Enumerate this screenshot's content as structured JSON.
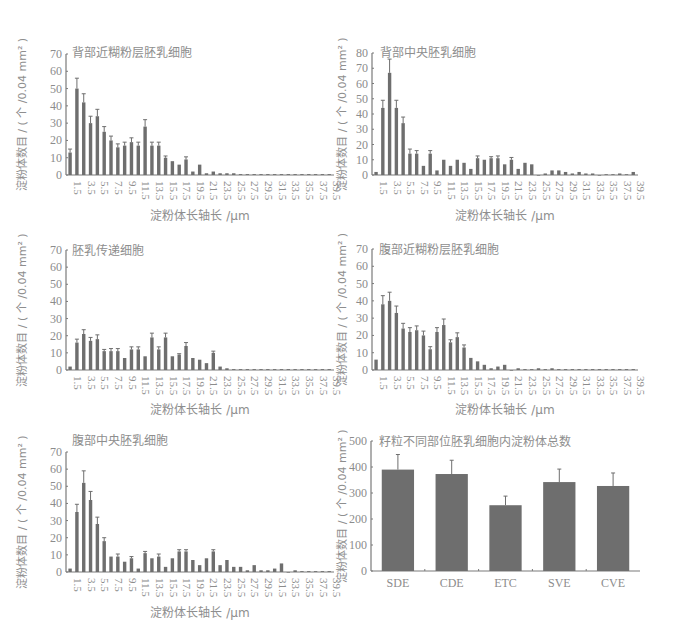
{
  "chart_data": [
    {
      "id": "sde",
      "type": "bar",
      "title": "背部近糊粉层胚乳细胞",
      "xlabel": "淀粉体长轴长 /μm",
      "ylabel": "淀粉体数目 / ( 个 /0.04 mm² )",
      "ylim": [
        0,
        70
      ],
      "yticks": [
        0,
        10,
        20,
        30,
        40,
        50,
        60,
        70
      ],
      "categories": [
        1.5,
        2.5,
        3.5,
        4.5,
        5.5,
        6.5,
        7.5,
        8.5,
        9.5,
        10.5,
        11.5,
        12.5,
        13.5,
        14.5,
        15.5,
        16.5,
        17.5,
        18.5,
        19.5,
        20.5,
        21.5,
        22.5,
        23.5,
        24.5,
        25.5,
        26.5,
        27.5,
        28.5,
        29.5,
        30.5,
        31.5,
        32.5,
        33.5,
        34.5,
        35.5,
        36.5,
        37.5,
        38.5,
        39.5
      ],
      "xtick_labels": [
        "1.5",
        "3.5",
        "5.5",
        "7.5",
        "9.5",
        "11.5",
        "13.5",
        "15.5",
        "17.5",
        "19.5",
        "21.5",
        "23.5",
        "25.5",
        "27.5",
        "29.5",
        "31.5",
        "33.5",
        "35.5",
        "37.5",
        "39.5"
      ],
      "values": [
        13,
        50,
        42,
        30,
        34,
        25,
        20,
        16,
        17,
        19,
        17,
        28,
        17,
        17,
        10,
        8,
        6,
        9,
        2,
        6,
        1,
        2,
        1,
        1,
        1,
        0.5,
        0.5,
        0.5,
        0.5,
        0.5,
        0.5,
        0.5,
        0.5,
        0.5,
        0.5,
        0.5,
        0.5,
        0.5,
        0.5
      ],
      "errors": [
        2,
        6,
        5,
        4,
        4,
        3,
        2.5,
        2,
        2,
        2.5,
        2,
        4,
        2,
        2,
        1,
        0,
        0,
        1.5,
        0,
        0,
        0,
        0,
        0,
        0,
        0,
        0,
        0,
        0,
        0,
        0,
        0,
        0,
        0,
        0,
        0,
        0,
        0,
        0,
        0
      ]
    },
    {
      "id": "cde",
      "type": "bar",
      "title": "背部中央胚乳细胞",
      "xlabel": "淀粉体长轴长 /μm",
      "ylabel": "淀粉体数目 / ( 个 /0.04 mm² )",
      "ylim": [
        0,
        80
      ],
      "yticks": [
        0,
        10,
        20,
        30,
        40,
        50,
        60,
        70,
        80
      ],
      "categories": [
        1.5,
        2.5,
        3.5,
        4.5,
        5.5,
        6.5,
        7.5,
        8.5,
        9.5,
        10.5,
        11.5,
        12.5,
        13.5,
        14.5,
        15.5,
        16.5,
        17.5,
        18.5,
        19.5,
        20.5,
        21.5,
        22.5,
        23.5,
        24.5,
        25.5,
        26.5,
        27.5,
        28.5,
        29.5,
        30.5,
        31.5,
        32.5,
        33.5,
        34.5,
        35.5,
        36.5,
        37.5,
        38.5,
        39.5
      ],
      "xtick_labels": [
        "1.5",
        "3.5",
        "5.5",
        "7.5",
        "9.5",
        "11.5",
        "13.5",
        "15.5",
        "17.5",
        "19.5",
        "21.5",
        "23.5",
        "25.5",
        "27.5",
        "29.5",
        "31.5",
        "33.5",
        "35.5",
        "37.5",
        "39.5"
      ],
      "values": [
        2,
        44,
        67,
        44,
        34,
        14,
        14,
        6,
        14,
        3,
        10,
        6,
        10,
        8,
        4,
        11,
        10,
        11,
        11,
        7,
        10,
        4,
        8,
        7,
        0,
        1,
        3,
        3,
        2,
        1,
        2,
        1,
        1,
        0,
        0.5,
        0.5,
        1,
        0.5,
        2
      ],
      "errors": [
        0,
        5,
        9,
        5,
        4,
        3,
        2,
        0,
        2,
        0,
        0,
        0,
        0,
        0,
        0,
        1.5,
        0,
        1,
        1.5,
        0,
        1.5,
        0,
        0,
        0,
        0,
        0,
        0,
        0,
        0,
        0,
        0,
        0,
        0,
        0,
        0,
        0,
        0,
        0,
        0
      ]
    },
    {
      "id": "etc",
      "type": "bar",
      "title": "胚乳传递细胞",
      "xlabel": "淀粉体长轴长 /μm",
      "ylabel": "淀粉体数目 / ( 个 /0.04 mm² )",
      "ylim": [
        0,
        70
      ],
      "yticks": [
        0,
        10,
        20,
        30,
        40,
        50,
        60,
        70
      ],
      "categories": [
        1.5,
        2.5,
        3.5,
        4.5,
        5.5,
        6.5,
        7.5,
        8.5,
        9.5,
        10.5,
        11.5,
        12.5,
        13.5,
        14.5,
        15.5,
        16.5,
        17.5,
        18.5,
        19.5,
        20.5,
        21.5,
        22.5,
        23.5,
        24.5,
        25.5,
        26.5,
        27.5,
        28.5,
        29.5,
        30.5,
        31.5,
        32.5,
        33.5,
        34.5,
        35.5,
        36.5,
        37.5,
        38.5,
        39.5
      ],
      "xtick_labels": [
        "1.5",
        "3.5",
        "5.5",
        "7.5",
        "9.5",
        "11.5",
        "13.5",
        "15.5",
        "17.5",
        "19.5",
        "21.5",
        "23.5",
        "25.5",
        "27.5",
        "29.5",
        "31.5",
        "33.5",
        "35.5",
        "37.5",
        "39.5"
      ],
      "values": [
        2,
        16,
        21,
        17,
        18,
        11,
        11,
        11,
        7,
        12,
        12,
        8,
        19,
        12,
        19,
        8,
        9,
        14,
        7,
        6,
        4,
        10,
        2,
        1,
        0.5,
        0.5,
        0.5,
        0.5,
        0.5,
        0.5,
        0.5,
        0.5,
        0.5,
        0.5,
        0.5,
        0.5,
        0.5,
        0.5,
        0.5
      ],
      "errors": [
        0,
        2,
        2.5,
        2,
        2.5,
        1,
        1.5,
        1.5,
        0,
        1.5,
        1.5,
        0,
        2.5,
        1.5,
        2.5,
        0,
        0.5,
        2,
        0,
        0,
        0,
        1,
        0,
        0,
        0,
        0,
        0,
        0,
        0,
        0,
        0,
        0,
        0,
        0,
        0,
        0,
        0,
        0,
        0
      ]
    },
    {
      "id": "sve",
      "type": "bar",
      "title": "腹部近糊粉层胚乳细胞",
      "xlabel": "淀粉体长轴长 /μm",
      "ylabel": "淀粉体数目 / ( 个 /0.04 mm² )",
      "ylim": [
        0,
        70
      ],
      "yticks": [
        0,
        10,
        20,
        30,
        40,
        50,
        60,
        70
      ],
      "categories": [
        1.5,
        2.5,
        3.5,
        4.5,
        5.5,
        6.5,
        7.5,
        8.5,
        9.5,
        10.5,
        11.5,
        12.5,
        13.5,
        14.5,
        15.5,
        16.5,
        17.5,
        18.5,
        19.5,
        20.5,
        21.5,
        22.5,
        23.5,
        24.5,
        25.5,
        26.5,
        27.5,
        28.5,
        29.5,
        30.5,
        31.5,
        32.5,
        33.5,
        34.5,
        35.5,
        36.5,
        37.5,
        38.5,
        39.5
      ],
      "xtick_labels": [
        "1.5",
        "3.5",
        "5.5",
        "7.5",
        "9.5",
        "11.5",
        "13.5",
        "15.5",
        "17.5",
        "19.5",
        "21.5",
        "23.5",
        "25.5",
        "27.5",
        "29.5",
        "31.5",
        "33.5",
        "35.5",
        "37.5",
        "39.5"
      ],
      "values": [
        6,
        38,
        40,
        33,
        24,
        22,
        23,
        20,
        12,
        22,
        26,
        16,
        19,
        13,
        7,
        5,
        3,
        1,
        2,
        3,
        0,
        1,
        0.5,
        0.5,
        1,
        0.5,
        1,
        0.5,
        0.5,
        0.5,
        0.5,
        0.5,
        0.5,
        0.5,
        0.5,
        0.5,
        0.5,
        0.5,
        0.5
      ],
      "errors": [
        0,
        5,
        5,
        4,
        3,
        2.5,
        2.5,
        2.5,
        1.5,
        2.5,
        3.5,
        1.5,
        2.5,
        1.5,
        0,
        0,
        0,
        0,
        0,
        0,
        0,
        0,
        0,
        0,
        0,
        0,
        0,
        0,
        0,
        0,
        0,
        0,
        0,
        0,
        0,
        0,
        0,
        0,
        0
      ]
    },
    {
      "id": "cve",
      "type": "bar",
      "title": "腹部中央胚乳细胞",
      "xlabel": "淀粉体长轴长 /μm",
      "ylabel": "淀粉体数目 / ( 个 /0.04 mm² )",
      "ylim": [
        0,
        70
      ],
      "yticks": [
        0,
        10,
        20,
        30,
        40,
        50,
        60,
        70
      ],
      "categories": [
        1.5,
        2.5,
        3.5,
        4.5,
        5.5,
        6.5,
        7.5,
        8.5,
        9.5,
        10.5,
        11.5,
        12.5,
        13.5,
        14.5,
        15.5,
        16.5,
        17.5,
        18.5,
        19.5,
        20.5,
        21.5,
        22.5,
        23.5,
        24.5,
        25.5,
        26.5,
        27.5,
        28.5,
        29.5,
        30.5,
        31.5,
        32.5,
        33.5,
        34.5,
        35.5,
        36.5,
        37.5,
        38.5,
        39.5
      ],
      "xtick_labels": [
        "1.5",
        "3.5",
        "5.5",
        "7.5",
        "9.5",
        "11.5",
        "13.5",
        "15.5",
        "17.5",
        "19.5",
        "21.5",
        "23.5",
        "25.5",
        "27.5",
        "29.5",
        "31.5",
        "33.5",
        "35.5",
        "37.5",
        "39.5"
      ],
      "values": [
        2,
        35,
        52,
        42,
        28,
        18,
        9,
        9,
        6,
        8,
        2,
        11,
        8,
        9,
        3,
        8,
        12,
        12,
        7,
        4,
        8,
        12,
        4,
        7,
        3,
        3,
        1,
        4,
        1,
        1,
        2,
        5,
        0,
        1,
        0.5,
        0.5,
        0.5,
        0.5,
        0.5
      ],
      "errors": [
        0,
        4.5,
        7,
        5,
        4,
        2,
        0,
        1.5,
        0,
        1,
        0,
        1,
        0,
        1.5,
        0,
        0,
        1,
        1,
        0,
        0,
        0,
        1,
        0,
        0,
        0,
        0,
        0,
        0,
        0,
        0,
        0,
        0,
        0,
        0,
        0,
        0,
        0,
        0,
        0
      ]
    },
    {
      "id": "total",
      "type": "bar",
      "title": "籽粒不同部位胚乳细胞内淀粉体总数",
      "xlabel": "",
      "ylabel": "淀粉体数目 / ( 个 /0.04 mm² )",
      "ylim": [
        0,
        500
      ],
      "yticks": [
        0,
        100,
        200,
        300,
        400,
        500
      ],
      "categories": [
        "SDE",
        "CDE",
        "ETC",
        "SVE",
        "CVE"
      ],
      "xtick_labels": [
        "SDE",
        "CDE",
        "ETC",
        "SVE",
        "CVE"
      ],
      "values": [
        390,
        373,
        253,
        342,
        327
      ],
      "errors": [
        58,
        53,
        35,
        50,
        50
      ]
    }
  ],
  "panels": [
    {
      "x0": 66,
      "x1": 334,
      "y0": 175,
      "ytop": 54,
      "ylabel_x": 26,
      "title_x": 72,
      "title_y": 57,
      "xlabel_x": 200,
      "xlabel_y": 220
    },
    {
      "x0": 372,
      "x1": 638,
      "y0": 175,
      "ytop": 53,
      "ylabel_x": 346,
      "title_x": 380,
      "title_y": 57,
      "xlabel_x": 505,
      "xlabel_y": 220
    },
    {
      "x0": 66,
      "x1": 334,
      "y0": 370,
      "ytop": 250,
      "ylabel_x": 26,
      "title_x": 72,
      "title_y": 255,
      "xlabel_x": 200,
      "xlabel_y": 414
    },
    {
      "x0": 372,
      "x1": 638,
      "y0": 370,
      "ytop": 249,
      "ylabel_x": 346,
      "title_x": 379,
      "title_y": 254,
      "xlabel_x": 505,
      "xlabel_y": 414
    },
    {
      "x0": 66,
      "x1": 334,
      "y0": 572,
      "ytop": 452,
      "ylabel_x": 26,
      "title_x": 72,
      "title_y": 445,
      "xlabel_x": 200,
      "xlabel_y": 617
    },
    {
      "x0": 371,
      "x1": 640,
      "y0": 571,
      "ytop": 441,
      "ylabel_x": 346,
      "title_x": 379,
      "title_y": 446,
      "xlabel_x": 505,
      "xlabel_y": 617
    }
  ],
  "colors": {
    "bar": "#6e6e6e",
    "axis": "#7a7a7a",
    "text": "#8c8c8c"
  }
}
